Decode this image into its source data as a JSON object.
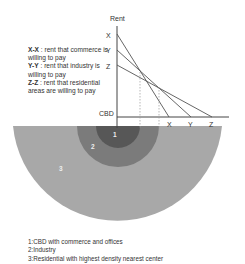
{
  "diagram": {
    "axis": {
      "y_label": "Rent",
      "x_origin_label": "CBD",
      "y_ticks": [
        "X",
        "Y",
        "Z"
      ],
      "x_ticks": [
        "X",
        "Y",
        "Z"
      ]
    },
    "curve_legend": [
      {
        "key": "X-X",
        "text": ": rent that commerce is willing to pay"
      },
      {
        "key": "Y-Y",
        "text": ": rent that industry is willing to pay"
      },
      {
        "key": "Z-Z",
        "text": ": rent that residential areas are willing to pay"
      }
    ],
    "zones": [
      {
        "label": "1",
        "color": "#575757"
      },
      {
        "label": "2",
        "color": "#7b7b7b"
      },
      {
        "label": "3",
        "color": "#a8a8a8"
      }
    ],
    "zone_legend": [
      "1:CBD with commerce and offices",
      "2:Industry",
      "3:Residential with highest density nearest center"
    ]
  }
}
